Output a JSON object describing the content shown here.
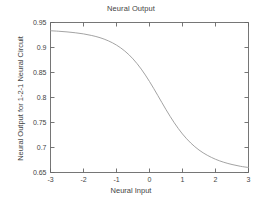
{
  "chart_data": {
    "type": "line",
    "title": "Neural Output",
    "xlabel": "Neural Input",
    "ylabel": "Neural Output for 1-2-1 Neural Circuit",
    "xlim": [
      -3,
      3
    ],
    "ylim": [
      0.65,
      0.95
    ],
    "xticks": [
      "-3",
      "-2",
      "-1",
      "0",
      "1",
      "2",
      "3"
    ],
    "xtick_values": [
      -3,
      -2,
      -1,
      0,
      1,
      2,
      3
    ],
    "yticks": [
      "0.95",
      "0.9",
      "0.85",
      "0.8",
      "0.75",
      "0.7",
      "0.65"
    ],
    "ytick_values": [
      0.95,
      0.9,
      0.85,
      0.8,
      0.75,
      0.7,
      0.65
    ],
    "grid": false,
    "legend": null,
    "line_color": "#999999",
    "frame_color": "#666666",
    "series": [
      {
        "name": "neural output",
        "x": [
          -3.0,
          -2.75,
          -2.5,
          -2.25,
          -2.0,
          -1.75,
          -1.5,
          -1.25,
          -1.0,
          -0.75,
          -0.5,
          -0.25,
          0.0,
          0.25,
          0.5,
          0.75,
          1.0,
          1.25,
          1.5,
          1.75,
          2.0,
          2.25,
          2.5,
          2.75,
          3.0
        ],
        "values": [
          0.9335,
          0.9325,
          0.9312,
          0.9295,
          0.9272,
          0.924,
          0.9196,
          0.9134,
          0.9048,
          0.893,
          0.8772,
          0.8568,
          0.832,
          0.8042,
          0.7758,
          0.7495,
          0.727,
          0.709,
          0.695,
          0.6845,
          0.6765,
          0.6705,
          0.666,
          0.6625,
          0.66
        ]
      }
    ]
  },
  "figure": {
    "title": "Neural Output",
    "xlabel": "Neural Input",
    "ylabel": "Neural Output for 1-2-1 Neural Circuit"
  }
}
